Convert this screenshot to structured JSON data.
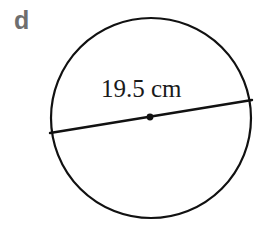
{
  "figure": {
    "background_color": "#ffffff",
    "width": 274,
    "height": 231,
    "part_label": "d",
    "part_label_color": "#6e6e6e",
    "stroke_color": "#111111",
    "shape": {
      "name": "circle",
      "center_x": 151,
      "center_y": 118,
      "radius": 100,
      "stroke_width": 2.2
    },
    "diameter_line": {
      "label": "19.5 cm",
      "value": 19.5,
      "unit": "cm",
      "x1": 50,
      "y1": 133,
      "x2": 252,
      "y2": 100,
      "stroke_width": 2.4
    },
    "center_dot": {
      "cx": 150,
      "cy": 117,
      "r": 3.4
    }
  }
}
